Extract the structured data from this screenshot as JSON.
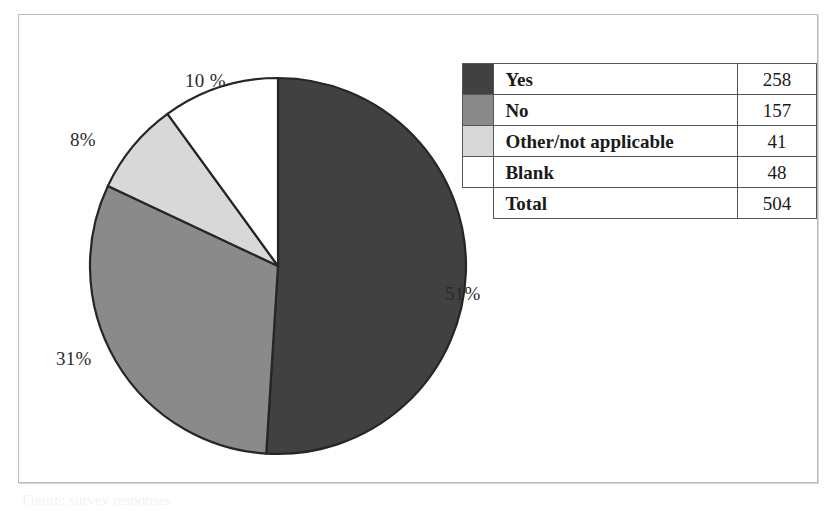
{
  "figure": {
    "caption_remnant": "Figure: survey responses"
  },
  "chart_data": {
    "type": "pie",
    "title": "",
    "categories": [
      "Yes",
      "No",
      "Other/not applicable",
      "Blank"
    ],
    "values": [
      258,
      157,
      41,
      48
    ],
    "percentages": [
      51,
      31,
      8,
      10
    ],
    "total": 504,
    "colors": [
      "#414141",
      "#8a8a8a",
      "#d8d8d8",
      "#ffffff"
    ],
    "slice_outline_color": "#262626",
    "start_angle_deg": 0,
    "direction": "clockwise",
    "legend_position": "right-table",
    "data_labels": [
      "51%",
      "31%",
      "8%",
      "10 %"
    ],
    "labels": {
      "yes": "51%",
      "no": "31%",
      "other": "8%",
      "blank": "10 %"
    }
  },
  "table": {
    "rows": [
      {
        "label": "Yes",
        "value": "258",
        "color": "#414141",
        "has_swatch": true
      },
      {
        "label": "No",
        "value": "157",
        "color": "#8a8a8a",
        "has_swatch": true
      },
      {
        "label": "Other/not applicable",
        "value": "41",
        "color": "#d8d8d8",
        "has_swatch": true
      },
      {
        "label": "Blank",
        "value": "48",
        "color": "#ffffff",
        "has_swatch": true
      },
      {
        "label": "Total",
        "value": "504",
        "color": "",
        "has_swatch": false
      }
    ]
  }
}
